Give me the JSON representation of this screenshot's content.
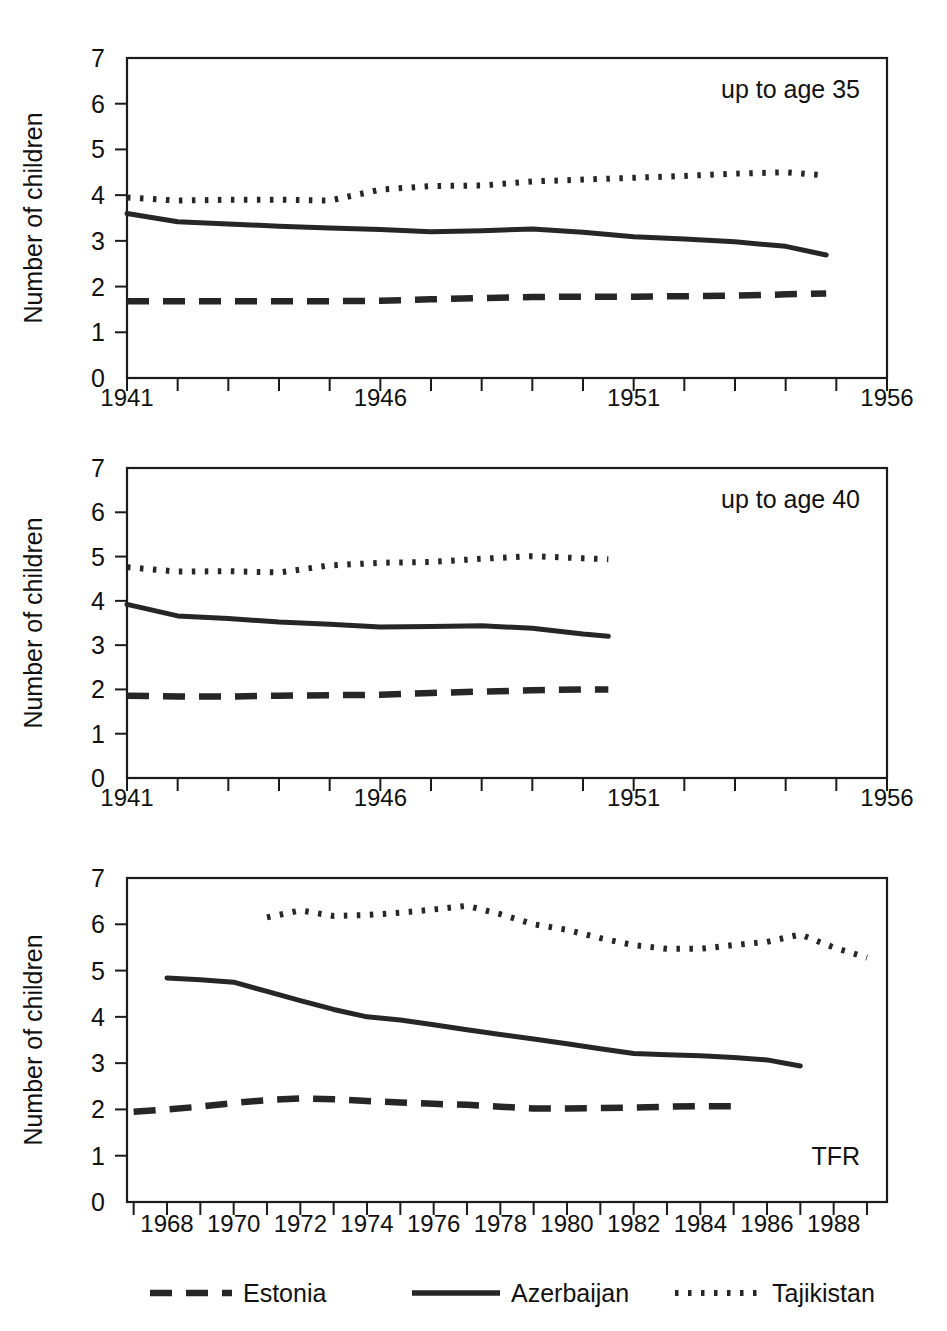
{
  "figure": {
    "y_axis_title": "Number of children",
    "legend": {
      "items": [
        {
          "label": "Estonia",
          "style": "dashed"
        },
        {
          "label": "Azerbaijan",
          "style": "solid"
        },
        {
          "label": "Tajikistan",
          "style": "dotted"
        }
      ]
    }
  },
  "chart_data": [
    {
      "type": "line",
      "title": "",
      "annotation": "up to age 35",
      "xlabel": "",
      "ylabel": "Number of children",
      "xlim": [
        1941,
        1956
      ],
      "ylim": [
        0,
        7
      ],
      "xticks": [
        1941,
        1942,
        1943,
        1944,
        1945,
        1946,
        1947,
        1948,
        1949,
        1950,
        1951,
        1952,
        1953,
        1954,
        1955,
        1956
      ],
      "xticklabels": [
        "1941",
        "",
        "",
        "",
        "",
        "1946",
        "",
        "",
        "",
        "",
        "1951",
        "",
        "",
        "",
        "",
        "1956"
      ],
      "yticks": [
        0,
        1,
        2,
        3,
        4,
        5,
        6,
        7
      ],
      "yticklabels": [
        "0",
        "1",
        "2",
        "3",
        "4",
        "5",
        "6",
        "7"
      ],
      "grid": false,
      "legend_position": "figure-bottom",
      "x": [
        1941,
        1942,
        1943,
        1944,
        1945,
        1946,
        1947,
        1948,
        1949,
        1950,
        1951,
        1952,
        1953,
        1954,
        1954.8
      ],
      "series": [
        {
          "name": "Estonia",
          "style": "dashed",
          "values": [
            1.68,
            1.68,
            1.68,
            1.68,
            1.68,
            1.69,
            1.72,
            1.75,
            1.77,
            1.78,
            1.78,
            1.79,
            1.8,
            1.83,
            1.85
          ]
        },
        {
          "name": "Azerbaijan",
          "style": "solid",
          "values": [
            3.6,
            3.42,
            3.37,
            3.32,
            3.28,
            3.25,
            3.2,
            3.22,
            3.26,
            3.19,
            3.09,
            3.04,
            2.98,
            2.88,
            2.69
          ]
        },
        {
          "name": "Tajikistan",
          "style": "dotted",
          "values": [
            3.95,
            3.88,
            3.9,
            3.9,
            3.88,
            4.12,
            4.2,
            4.21,
            4.3,
            4.34,
            4.38,
            4.42,
            4.47,
            4.5,
            4.43
          ]
        }
      ]
    },
    {
      "type": "line",
      "title": "",
      "annotation": "up to age 40",
      "xlabel": "",
      "ylabel": "Number of children",
      "xlim": [
        1941,
        1956
      ],
      "ylim": [
        0,
        7
      ],
      "xticks": [
        1941,
        1942,
        1943,
        1944,
        1945,
        1946,
        1947,
        1948,
        1949,
        1950,
        1951,
        1952,
        1953,
        1954,
        1955,
        1956
      ],
      "xticklabels": [
        "1941",
        "",
        "",
        "",
        "",
        "1946",
        "",
        "",
        "",
        "",
        "1951",
        "",
        "",
        "",
        "",
        "1956"
      ],
      "yticks": [
        0,
        1,
        2,
        3,
        4,
        5,
        6,
        7
      ],
      "yticklabels": [
        "0",
        "1",
        "2",
        "3",
        "4",
        "5",
        "6",
        "7"
      ],
      "grid": false,
      "legend_position": "figure-bottom",
      "x": [
        1941,
        1942,
        1943,
        1944,
        1945,
        1946,
        1947,
        1948,
        1949,
        1950,
        1950.5
      ],
      "series": [
        {
          "name": "Estonia",
          "style": "dashed",
          "values": [
            1.86,
            1.84,
            1.84,
            1.86,
            1.87,
            1.88,
            1.92,
            1.95,
            1.98,
            2.0,
            2.0
          ]
        },
        {
          "name": "Azerbaijan",
          "style": "solid",
          "values": [
            3.92,
            3.66,
            3.6,
            3.52,
            3.47,
            3.41,
            3.42,
            3.44,
            3.38,
            3.25,
            3.2
          ]
        },
        {
          "name": "Tajikistan",
          "style": "dotted",
          "values": [
            4.76,
            4.66,
            4.67,
            4.64,
            4.8,
            4.86,
            4.88,
            4.95,
            5.01,
            4.96,
            4.94
          ]
        }
      ]
    },
    {
      "type": "line",
      "title": "",
      "annotation": "TFR",
      "xlabel": "",
      "ylabel": "Number of children",
      "xlim": [
        1966.8,
        1989.6
      ],
      "ylim": [
        0,
        7
      ],
      "xticks": [
        1967,
        1968,
        1969,
        1970,
        1971,
        1972,
        1973,
        1974,
        1975,
        1976,
        1977,
        1978,
        1979,
        1980,
        1981,
        1982,
        1983,
        1984,
        1985,
        1986,
        1987,
        1988,
        1989
      ],
      "xticklabels": [
        "",
        "1968",
        "",
        "1970",
        "",
        "1972",
        "",
        "1974",
        "",
        "1976",
        "",
        "1978",
        "",
        "1980",
        "",
        "1982",
        "",
        "1984",
        "",
        "1986",
        "",
        "1988",
        ""
      ],
      "yticks": [
        0,
        1,
        2,
        3,
        4,
        5,
        6,
        7
      ],
      "yticklabels": [
        "0",
        "1",
        "2",
        "3",
        "4",
        "5",
        "6",
        "7"
      ],
      "grid": false,
      "legend_position": "figure-bottom",
      "series": [
        {
          "name": "Estonia",
          "style": "dashed",
          "x": [
            1967,
            1968,
            1969,
            1970,
            1971,
            1972,
            1973,
            1974,
            1975,
            1976,
            1977,
            1978,
            1979,
            1980,
            1981,
            1982,
            1983,
            1984,
            1985
          ],
          "values": [
            1.95,
            2.0,
            2.06,
            2.14,
            2.2,
            2.24,
            2.22,
            2.18,
            2.15,
            2.12,
            2.1,
            2.06,
            2.02,
            2.02,
            2.03,
            2.04,
            2.06,
            2.07,
            2.07
          ]
        },
        {
          "name": "Azerbaijan",
          "style": "solid",
          "x": [
            1968,
            1969,
            1970,
            1971,
            1972,
            1973,
            1974,
            1975,
            1976,
            1977,
            1978,
            1979,
            1980,
            1981,
            1982,
            1983,
            1984,
            1985,
            1986,
            1987
          ],
          "values": [
            4.84,
            4.8,
            4.75,
            4.55,
            4.35,
            4.16,
            4.0,
            3.93,
            3.83,
            3.72,
            3.62,
            3.52,
            3.42,
            3.31,
            3.21,
            3.18,
            3.16,
            3.12,
            3.07,
            2.94
          ]
        },
        {
          "name": "Tajikistan",
          "style": "dotted",
          "x": [
            1971,
            1972,
            1973,
            1974,
            1975,
            1976,
            1977,
            1978,
            1979,
            1980,
            1981,
            1982,
            1983,
            1984,
            1985,
            1986,
            1987,
            1988,
            1989
          ],
          "values": [
            6.15,
            6.3,
            6.18,
            6.2,
            6.25,
            6.32,
            6.4,
            6.22,
            6.0,
            5.88,
            5.7,
            5.55,
            5.47,
            5.47,
            5.55,
            5.62,
            5.78,
            5.5,
            5.28
          ]
        }
      ]
    }
  ]
}
